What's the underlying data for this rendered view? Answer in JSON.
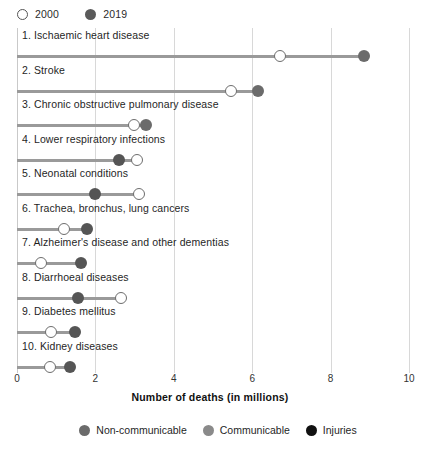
{
  "year_legend": {
    "items": [
      {
        "label": "2000",
        "marker": "open-circle-icon"
      },
      {
        "label": "2019",
        "marker": "filled-circle-icon"
      }
    ]
  },
  "category_legend": {
    "items": [
      {
        "label": "Non-communicable",
        "color": "#6b6b6b"
      },
      {
        "label": "Communicable",
        "color": "#8a8a8a"
      },
      {
        "label": "Injuries",
        "color": "#111111"
      }
    ]
  },
  "chart_data": {
    "type": "scatter",
    "subtype": "dumbbell",
    "title": "",
    "xlabel": "Number of deaths (in millions)",
    "ylabel": "",
    "xlim": [
      0,
      10
    ],
    "xticks": [
      0,
      2,
      4,
      6,
      8,
      10
    ],
    "grid": true,
    "legend_position": "bottom",
    "series": [
      {
        "name": "2000",
        "marker": "open-circle"
      },
      {
        "name": "2019",
        "marker": "filled-circle"
      }
    ],
    "categories": [
      "1. Ischaemic heart disease",
      "2. Stroke",
      "3. Chronic obstructive pulmonary disease",
      "4. Lower respiratory infections",
      "5. Neonatal conditions",
      "6. Trachea, bronchus, lung cancers",
      "7. Alzheimer's disease and other dementias",
      "8. Diarrhoeal diseases",
      "9. Diabetes mellitus",
      "10. Kidney diseases"
    ],
    "rows": [
      {
        "label": "1. Ischaemic heart disease",
        "v2000": 6.7,
        "v2019": 8.85,
        "group": "Non-communicable",
        "color": "#6b6b6b"
      },
      {
        "label": "2. Stroke",
        "v2000": 5.45,
        "v2019": 6.15,
        "group": "Non-communicable",
        "color": "#6b6b6b"
      },
      {
        "label": "3. Chronic obstructive pulmonary disease",
        "v2000": 2.98,
        "v2019": 3.28,
        "group": "Non-communicable",
        "color": "#6b6b6b"
      },
      {
        "label": "4. Lower respiratory infections",
        "v2000": 3.05,
        "v2019": 2.6,
        "group": "Communicable",
        "color": "#555555"
      },
      {
        "label": "5. Neonatal conditions",
        "v2000": 3.1,
        "v2019": 2.0,
        "group": "Communicable",
        "color": "#555555"
      },
      {
        "label": "6. Trachea, bronchus, lung cancers",
        "v2000": 1.2,
        "v2019": 1.78,
        "group": "Non-communicable",
        "color": "#555555"
      },
      {
        "label": "7. Alzheimer's disease and other dementias",
        "v2000": 0.62,
        "v2019": 1.64,
        "group": "Non-communicable",
        "color": "#555555"
      },
      {
        "label": "8. Diarrhoeal diseases",
        "v2000": 2.65,
        "v2019": 1.55,
        "group": "Communicable",
        "color": "#555555"
      },
      {
        "label": "9. Diabetes mellitus",
        "v2000": 0.88,
        "v2019": 1.48,
        "group": "Non-communicable",
        "color": "#555555"
      },
      {
        "label": "10. Kidney diseases",
        "v2000": 0.83,
        "v2019": 1.36,
        "group": "Non-communicable",
        "color": "#555555"
      }
    ]
  }
}
